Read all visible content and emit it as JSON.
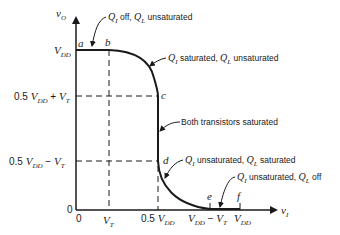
{
  "diagram": {
    "y_axis": {
      "label": "v",
      "label_sub": "O"
    },
    "x_axis": {
      "label": "v",
      "label_sub": "I"
    },
    "y_ticks": [
      {
        "id": "vdd",
        "main": "V",
        "sub": "DD",
        "prefix": ""
      },
      {
        "id": "half_plus",
        "prefix": "0.5 ",
        "main": "V",
        "sub": "DD",
        "suffix": " + ",
        "main2": "V",
        "sub2": "T"
      },
      {
        "id": "half_minus",
        "prefix": "0.5 ",
        "main": "V",
        "sub": "DD",
        "suffix": " − ",
        "main2": "V",
        "sub2": "T"
      },
      {
        "id": "zero",
        "main": "0"
      }
    ],
    "x_ticks": [
      {
        "id": "zero",
        "main": "0"
      },
      {
        "id": "vt",
        "main": "V",
        "sub": "T"
      },
      {
        "id": "half_vdd",
        "prefix": "0.5 ",
        "main": "V",
        "sub": "DD"
      },
      {
        "id": "vdd_minus_vt",
        "main": "V",
        "sub": "DD",
        "suffix": " − ",
        "main2": "V",
        "sub2": "T"
      },
      {
        "id": "vdd",
        "main": "V",
        "sub": "DD"
      }
    ],
    "points": [
      "a",
      "b",
      "c",
      "d",
      "e",
      "f"
    ],
    "annotations": [
      {
        "q1": "Q",
        "q1s": "I",
        "t1": " off, ",
        "q2": "Q",
        "q2s": "L",
        "t2": " unsaturated"
      },
      {
        "q1": "Q",
        "q1s": "I",
        "t1": " saturated, ",
        "q2": "Q",
        "q2s": "L",
        "t2": " unsaturated"
      },
      {
        "text": "Both transistors saturated"
      },
      {
        "q1": "Q",
        "q1s": "I",
        "t1": " unsaturated, ",
        "q2": "Q",
        "q2s": "L",
        "t2": " saturated"
      },
      {
        "q1": "Q",
        "q1s": "I",
        "t1": " unsaturated, ",
        "q2": "Q",
        "q2s": "L",
        "t2": " off"
      }
    ]
  }
}
